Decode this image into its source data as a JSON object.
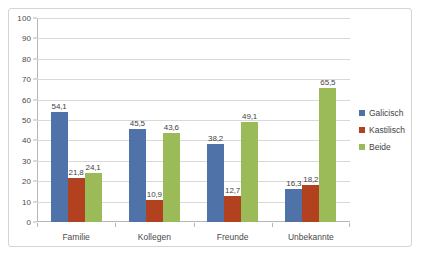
{
  "chart_data": {
    "type": "bar",
    "title": "",
    "subtitle": "",
    "xlabel": "",
    "ylabel": "",
    "ylim": [
      0,
      100
    ],
    "ytick_step": 10,
    "yticks": [
      0,
      10,
      20,
      30,
      40,
      50,
      60,
      70,
      80,
      90,
      100
    ],
    "ytick_labels": [
      "0",
      "10",
      "20",
      "30",
      "40",
      "50",
      "60",
      "70",
      "80",
      "90",
      "100"
    ],
    "grid": true,
    "grid_axis": "y",
    "legend_position": "right",
    "categories": [
      "Familie",
      "Kollegen",
      "Freunde",
      "Unbekannte"
    ],
    "series": [
      {
        "name": "Galicisch",
        "color": "#4F73A8",
        "values": [
          54.1,
          45.5,
          38.2,
          16.3
        ],
        "labels": [
          "54,1",
          "45,5",
          "38,2",
          "16,3"
        ]
      },
      {
        "name": "Kastilisch",
        "color": "#B1411F",
        "values": [
          21.8,
          10.9,
          12.7,
          18.2
        ],
        "labels": [
          "21,8",
          "10,9",
          "12,7",
          "18,2"
        ]
      },
      {
        "name": "Beide",
        "color": "#9BBB59",
        "values": [
          24.1,
          43.6,
          49.1,
          65.5
        ],
        "labels": [
          "24,1",
          "43,6",
          "49,1",
          "65,5"
        ]
      }
    ]
  },
  "colors": {
    "galicisch": "#4F73A8",
    "kastilisch": "#B1411F",
    "beide": "#9BBB59",
    "gridline": "#d9d9d9",
    "axis": "#b6b6b6",
    "border": "#d4d4d4",
    "text": "#4a4a4a",
    "background": "#ffffff"
  }
}
